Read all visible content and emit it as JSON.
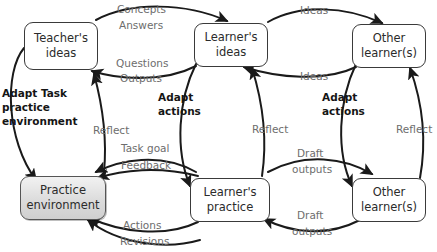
{
  "diagram": {
    "nodes": [
      {
        "id": "teacher-ideas",
        "line1": "Teacher's",
        "line2": "ideas",
        "shaded": false
      },
      {
        "id": "learner-ideas",
        "line1": "Learner's",
        "line2": "ideas",
        "shaded": false
      },
      {
        "id": "other-learners-top",
        "line1": "Other",
        "line2": "learner(s)",
        "shaded": false
      },
      {
        "id": "practice-environment",
        "line1": "Practice",
        "line2": "environment",
        "shaded": true
      },
      {
        "id": "learner-practice",
        "line1": "Learner's",
        "line2": "practice",
        "shaded": false
      },
      {
        "id": "other-learners-bottom",
        "line1": "Other",
        "line2": "learner(s)",
        "shaded": false
      }
    ],
    "edge_labels": [
      {
        "id": "concepts",
        "text": "Concepts"
      },
      {
        "id": "answers",
        "text": "Answers"
      },
      {
        "id": "questions",
        "text": "Questions"
      },
      {
        "id": "outputs",
        "text": "Outputs"
      },
      {
        "id": "ideas-top",
        "text": "Ideas"
      },
      {
        "id": "ideas-bottom",
        "text": "Ideas"
      },
      {
        "id": "reflect-left",
        "text": "Reflect"
      },
      {
        "id": "reflect-middle",
        "text": "Reflect"
      },
      {
        "id": "reflect-right",
        "text": "Reflect"
      },
      {
        "id": "task-goal",
        "text": "Task goal"
      },
      {
        "id": "feedback",
        "text": "Feedback"
      },
      {
        "id": "draft-outputs-upper",
        "text": "Draft"
      },
      {
        "id": "draft-outputs-upper2",
        "text": "outputs"
      },
      {
        "id": "draft-outputs-lower",
        "text": "Draft"
      },
      {
        "id": "draft-outputs-lower2",
        "text": "outputs"
      },
      {
        "id": "actions",
        "text": "Actions"
      },
      {
        "id": "revisions",
        "text": "Revisions"
      }
    ],
    "annotations": [
      {
        "id": "adapt-task-practice-environment",
        "line1": "Adapt Task",
        "line2": "practice",
        "line3": "environment"
      },
      {
        "id": "adapt-actions-middle",
        "line1": "Adapt",
        "line2": "actions"
      },
      {
        "id": "adapt-actions-right",
        "line1": "Adapt",
        "line2": "actions"
      }
    ],
    "colors": {
      "stroke": "#1a1a1a",
      "node_border": "#3a3a3a",
      "node_fill": "#ffffff",
      "shaded_fill": "#dcdcdc",
      "edge_label": "#6d6d6d",
      "annotation_text": "#151515",
      "background": "#ffffff"
    }
  }
}
